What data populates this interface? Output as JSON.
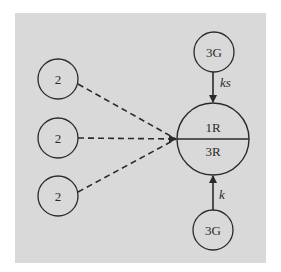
{
  "diagram": {
    "background_color": "#d9d9d9",
    "stroke_color": "#2a2a2a",
    "nodes": {
      "left_top": {
        "label": "2"
      },
      "left_middle": {
        "label": "2"
      },
      "left_bottom": {
        "label": "2"
      },
      "center": {
        "upper_label": "1R",
        "lower_label": "3R"
      },
      "top": {
        "label": "3G"
      },
      "bottom": {
        "label": "3G"
      }
    },
    "edges": {
      "top_to_center": {
        "label": "ks",
        "style": "solid-arrow"
      },
      "bottom_to_center": {
        "label": "k",
        "style": "solid-arrow"
      },
      "left_top_to_center": {
        "style": "dashed"
      },
      "left_middle_to_center": {
        "style": "dashed-arrow"
      },
      "left_bottom_to_center": {
        "style": "dashed"
      }
    }
  }
}
